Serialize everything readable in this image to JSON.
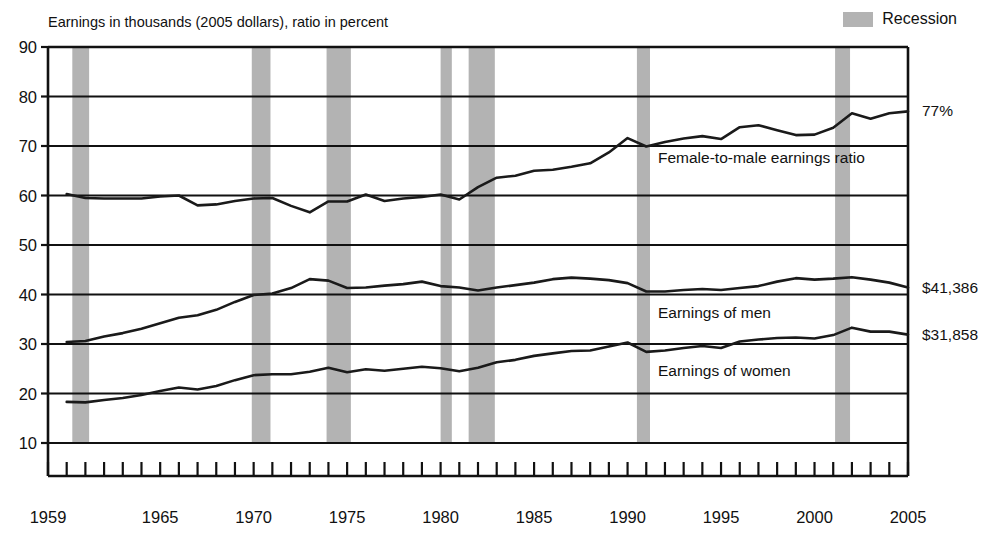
{
  "chart_data": {
    "type": "line",
    "title": "",
    "subtitle": "",
    "axis_note": "Earnings in thousands (2005 dollars), ratio in percent",
    "xlabel": "",
    "ylabel": "",
    "xlim": [
      1959,
      2005
    ],
    "ylim": [
      10,
      90
    ],
    "ytick_step": 10,
    "grid": true,
    "legend_position": "top-right",
    "ytick_labels": [
      "10",
      "20",
      "30",
      "40",
      "50",
      "60",
      "70",
      "80",
      "90"
    ],
    "xtick_labels": [
      "1959",
      "1965",
      "1970",
      "1975",
      "1980",
      "1985",
      "1990",
      "1995",
      "2000",
      "2005"
    ],
    "xtick_values": [
      1959,
      1965,
      1970,
      1975,
      1980,
      1985,
      1990,
      1995,
      2000,
      2005
    ],
    "x": [
      1960,
      1961,
      1962,
      1963,
      1964,
      1965,
      1966,
      1967,
      1968,
      1969,
      1970,
      1971,
      1972,
      1973,
      1974,
      1975,
      1976,
      1977,
      1978,
      1979,
      1980,
      1981,
      1982,
      1983,
      1984,
      1985,
      1986,
      1987,
      1988,
      1989,
      1990,
      1991,
      1992,
      1993,
      1994,
      1995,
      1996,
      1997,
      1998,
      1999,
      2000,
      2001,
      2002,
      2003,
      2004,
      2005
    ],
    "series": [
      {
        "name": "Female-to-male earnings ratio",
        "label": "Female-to-male earnings ratio",
        "units": "percent",
        "end_label": "77%",
        "end_value": 77,
        "values": [
          60.3,
          59.5,
          59.4,
          59.4,
          59.4,
          59.8,
          60.0,
          58.0,
          58.2,
          58.9,
          59.4,
          59.5,
          57.9,
          56.6,
          58.8,
          58.8,
          60.2,
          58.9,
          59.4,
          59.7,
          60.2,
          59.2,
          61.7,
          63.6,
          64.0,
          65.0,
          65.2,
          65.8,
          66.5,
          68.7,
          71.6,
          69.9,
          70.8,
          71.5,
          72.0,
          71.4,
          73.8,
          74.2,
          73.2,
          72.2,
          72.3,
          73.7,
          76.6,
          75.5,
          76.6,
          77.0
        ]
      },
      {
        "name": "Earnings of men",
        "label": "Earnings of men",
        "units": "thousands of 2005 dollars",
        "end_label": "$41,386",
        "end_value": 41.386,
        "values": [
          30.4,
          30.6,
          31.5,
          32.2,
          33.1,
          34.2,
          35.3,
          35.8,
          36.9,
          38.5,
          39.9,
          40.2,
          41.3,
          43.1,
          42.8,
          41.3,
          41.4,
          41.8,
          42.1,
          42.6,
          41.7,
          41.4,
          40.8,
          41.4,
          41.9,
          42.4,
          43.1,
          43.4,
          43.2,
          42.9,
          42.3,
          40.6,
          40.6,
          40.9,
          41.1,
          40.9,
          41.3,
          41.7,
          42.6,
          43.3,
          43.0,
          43.2,
          43.5,
          43.0,
          42.4,
          41.4
        ]
      },
      {
        "name": "Earnings of women",
        "label": "Earnings of women",
        "units": "thousands of 2005 dollars",
        "end_label": "$31,858",
        "end_value": 31.858,
        "values": [
          18.3,
          18.2,
          18.7,
          19.1,
          19.7,
          20.5,
          21.2,
          20.8,
          21.5,
          22.7,
          23.7,
          23.9,
          23.9,
          24.4,
          25.2,
          24.3,
          24.9,
          24.6,
          25.0,
          25.4,
          25.1,
          24.5,
          25.2,
          26.3,
          26.8,
          27.6,
          28.1,
          28.6,
          28.7,
          29.5,
          30.3,
          28.4,
          28.7,
          29.2,
          29.6,
          29.2,
          30.5,
          30.9,
          31.2,
          31.3,
          31.1,
          31.8,
          33.3,
          32.5,
          32.5,
          31.9
        ]
      }
    ],
    "recessions": [
      {
        "start": 1960.3,
        "end": 1961.2
      },
      {
        "start": 1969.9,
        "end": 1970.9
      },
      {
        "start": 1973.9,
        "end": 1975.2
      },
      {
        "start": 1980.0,
        "end": 1980.6
      },
      {
        "start": 1981.5,
        "end": 1982.9
      },
      {
        "start": 1990.5,
        "end": 1991.2
      },
      {
        "start": 2001.1,
        "end": 2001.9
      }
    ],
    "recession_legend": "Recession",
    "recession_color": "#b3b3b3",
    "line_color": "#1a1a1a"
  }
}
